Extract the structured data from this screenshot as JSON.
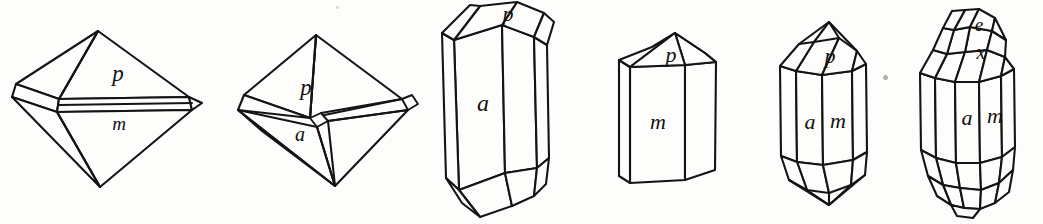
{
  "plate": {
    "title": "Crystal habit figures",
    "width": 1043,
    "height": 224,
    "background_color": "#fdfdfb",
    "ink_color": "#141414",
    "style": "line drawing"
  },
  "figures": [
    {
      "id": "figure-1",
      "name": "bipyramid-with-prism-band",
      "description": "Octahedral bipyramid truncated by a narrow horizontal prism band",
      "labels": [
        {
          "text": "p",
          "role": "pyramid-face",
          "x": 118,
          "y": 75
        },
        {
          "text": "m",
          "role": "prism-face",
          "x": 119,
          "y": 125
        }
      ]
    },
    {
      "id": "figure-2",
      "name": "bipyramid-with-small-basal-face",
      "description": "Bipyramid with a small rhombic truncation face at the waist",
      "labels": [
        {
          "text": "p",
          "role": "pyramid-face",
          "x": 306,
          "y": 88
        },
        {
          "text": "a",
          "role": "truncation-face",
          "x": 278,
          "y": 130
        }
      ]
    },
    {
      "id": "figure-3",
      "name": "long-prism-doubly-terminated",
      "description": "Elongated prism with rhombohedral terminations top and bottom",
      "labels": [
        {
          "text": "p",
          "role": "termination-face",
          "x": 508,
          "y": 15
        },
        {
          "text": "a",
          "role": "prism-face",
          "x": 483,
          "y": 104
        }
      ]
    },
    {
      "id": "figure-4",
      "name": "short-prism-pyramidal-cap",
      "description": "Short prism with a simple pyramidal cap",
      "labels": [
        {
          "text": "p",
          "role": "termination-face",
          "x": 671,
          "y": 55
        },
        {
          "text": "m",
          "role": "prism-face",
          "x": 658,
          "y": 122
        }
      ]
    },
    {
      "id": "figure-5",
      "name": "prism-two-face-forms",
      "description": "Doubly terminated prism showing two distinct prism forms",
      "labels": [
        {
          "text": "p",
          "role": "termination-face",
          "x": 825,
          "y": 56
        },
        {
          "text": "a",
          "role": "prism-face",
          "x": 810,
          "y": 122
        },
        {
          "text": "m",
          "role": "prism-face",
          "x": 838,
          "y": 121
        }
      ]
    },
    {
      "id": "figure-6",
      "name": "prism-with-modifying-forms",
      "description": "Doubly terminated prism with additional small modifying faces",
      "labels": [
        {
          "text": "e",
          "role": "modifying-face",
          "x": 979,
          "y": 27
        },
        {
          "text": "x",
          "role": "modifying-face",
          "x": 981,
          "y": 54
        },
        {
          "text": "a",
          "role": "prism-face",
          "x": 975,
          "y": 118
        },
        {
          "text": "m",
          "role": "prism-face",
          "x": 1003,
          "y": 117
        }
      ]
    }
  ],
  "artifacts": [
    {
      "name": "speck",
      "x": 885,
      "y": 77,
      "size": 4
    },
    {
      "name": "speck",
      "x": 337,
      "y": 7,
      "size": 3
    }
  ]
}
